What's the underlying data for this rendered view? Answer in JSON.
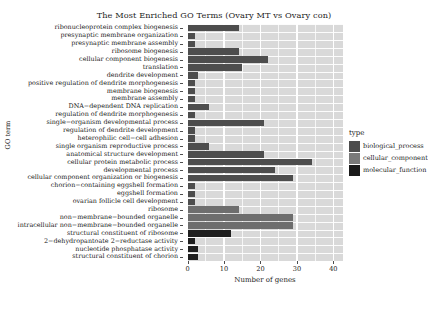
{
  "chart_data": {
    "type": "bar",
    "orientation": "horizontal",
    "title": "The Most Enriched GO Terms (Ovary MT vs Ovary con)",
    "xlabel": "Number of genes",
    "ylabel": "GO term",
    "xlim": [
      0,
      42.5
    ],
    "xticks": [
      0,
      10,
      20,
      30,
      40
    ],
    "xtick_labels": [
      "0",
      "10",
      "20",
      "30",
      "40"
    ],
    "grid": true,
    "legend": {
      "title": "type",
      "position": "right",
      "entries": [
        {
          "label": "biological_process",
          "color": "#4d4d4d"
        },
        {
          "label": "cellular_component",
          "color": "#7a7a7a"
        },
        {
          "label": "molecular_function",
          "color": "#1a1a1a"
        }
      ]
    },
    "categories": [
      "ribonucleoprotein complex biogenesis",
      "presynaptic membrane organization",
      "presynaptic membrane assembly",
      "ribosome biogenesis",
      "cellular component biogenesis",
      "translation",
      "dendrite development",
      "positive regulation of dendrite morphogenesis",
      "membrane biogenesis",
      "membrane assembly",
      "DNA−dependent DNA replication",
      "regulation of dendrite morphogenesis",
      "single−organism developmental process",
      "regulation of dendrite development",
      "heterophilic cell−cell adhesion",
      "single organism reproductive process",
      "anatomical structure development",
      "cellular protein metabolic process",
      "developmental process",
      "cellular component organization or biogenesis",
      "chorion−containing eggshell formation",
      "eggshell formation",
      "ovarian follicle cell development",
      "ribosome",
      "non−membrane−bounded organelle",
      "intracellular non−membrane−bounded organelle",
      "structural constituent of ribosome",
      "2−dehydropantoate 2−reductase activity",
      "nucleotide phosphatase activity",
      "structural constituent of chorion"
    ],
    "values": [
      14,
      2,
      2,
      14,
      22,
      15,
      3,
      2,
      2,
      2,
      6,
      2,
      21,
      2,
      2,
      6,
      21,
      34,
      24,
      29,
      2,
      2,
      2,
      14,
      29,
      29,
      12,
      2,
      3,
      3
    ],
    "types": [
      "biological_process",
      "biological_process",
      "biological_process",
      "biological_process",
      "biological_process",
      "biological_process",
      "biological_process",
      "biological_process",
      "biological_process",
      "biological_process",
      "biological_process",
      "biological_process",
      "biological_process",
      "biological_process",
      "biological_process",
      "biological_process",
      "biological_process",
      "biological_process",
      "biological_process",
      "biological_process",
      "biological_process",
      "biological_process",
      "biological_process",
      "cellular_component",
      "cellular_component",
      "cellular_component",
      "molecular_function",
      "molecular_function",
      "molecular_function",
      "molecular_function"
    ],
    "colors": {
      "biological_process": "#4d4d4d",
      "cellular_component": "#6e6e6e",
      "molecular_function": "#1f1f1f"
    },
    "panel_background": "#d9d9d9",
    "gridline_color": "#ffffff"
  }
}
